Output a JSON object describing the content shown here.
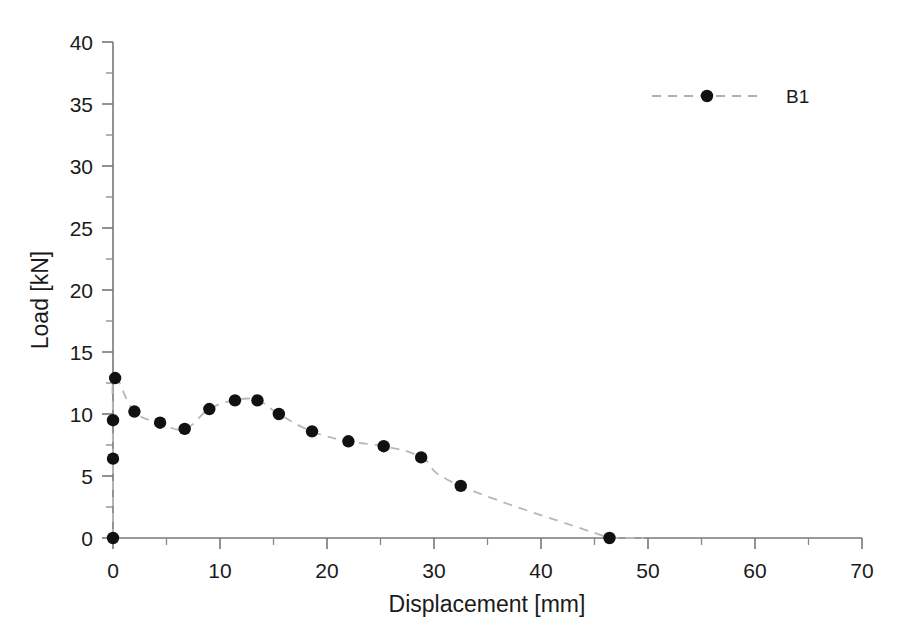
{
  "chart_data": {
    "type": "scatter",
    "title": "",
    "xlabel": "Displacement [mm]",
    "ylabel": "Load [kN]",
    "xlim": [
      0,
      70
    ],
    "ylim": [
      0,
      40
    ],
    "x_major_ticks": [
      0,
      10,
      20,
      30,
      40,
      50,
      60,
      70
    ],
    "x_minor_step": 5,
    "y_major_ticks": [
      0,
      5,
      10,
      15,
      20,
      25,
      30,
      35,
      40
    ],
    "y_minor_step": 2.5,
    "x_tick_labels": [
      "0",
      "10",
      "20",
      "30",
      "40",
      "50",
      "60",
      "70"
    ],
    "y_tick_labels": [
      "0",
      "5",
      "10",
      "15",
      "20",
      "25",
      "30",
      "35",
      "40"
    ],
    "grid": false,
    "legend_position": "top-right",
    "marker_style": "filled-circle",
    "marker_color": "#111111",
    "line_style": "dashed",
    "line_color": "#b8b8b8",
    "series": [
      {
        "name": "B1",
        "points": [
          {
            "x": 0.0,
            "y": 0.0
          },
          {
            "x": 0.0,
            "y": 6.4
          },
          {
            "x": 0.0,
            "y": 9.5
          },
          {
            "x": 0.2,
            "y": 12.9
          },
          {
            "x": 2.0,
            "y": 10.2
          },
          {
            "x": 4.4,
            "y": 9.3
          },
          {
            "x": 6.7,
            "y": 8.8
          },
          {
            "x": 9.0,
            "y": 10.4
          },
          {
            "x": 11.4,
            "y": 11.1
          },
          {
            "x": 13.5,
            "y": 11.1
          },
          {
            "x": 15.5,
            "y": 10.0
          },
          {
            "x": 18.6,
            "y": 8.6
          },
          {
            "x": 22.0,
            "y": 7.8
          },
          {
            "x": 25.3,
            "y": 7.4
          },
          {
            "x": 28.8,
            "y": 6.5
          },
          {
            "x": 32.5,
            "y": 4.2
          },
          {
            "x": 46.4,
            "y": 0.0
          }
        ]
      }
    ]
  },
  "legend": {
    "entries": [
      {
        "label": "B1"
      }
    ]
  }
}
